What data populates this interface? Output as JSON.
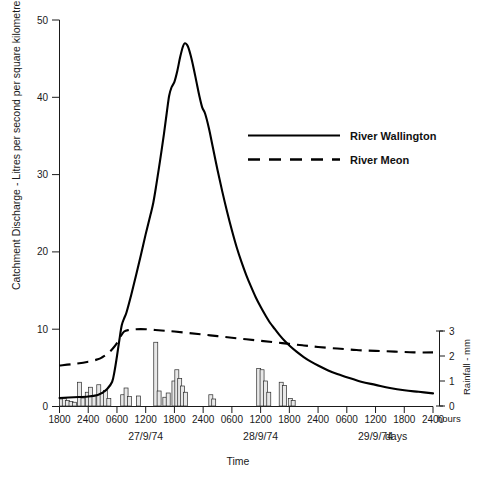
{
  "chart_data": {
    "type": "line",
    "title": "",
    "xlabel": "Time",
    "ylabel": "Catchment Discharge - Litres per second per square kilometre",
    "y2label": "Rainfall - mm",
    "xlim": [
      0,
      54
    ],
    "ylim": [
      0,
      50
    ],
    "y2lim": [
      0,
      3
    ],
    "grid": false,
    "legend_position": "upper right",
    "x_unit_label": "hours",
    "day_unit_label": "days",
    "x_tick_labels": [
      "1800",
      "2400",
      "0600",
      "1200",
      "1800",
      "2400",
      "0600",
      "1200",
      "1800",
      "2400",
      "0600",
      "1200",
      "1800",
      "2400"
    ],
    "x_tick_hours": [
      0,
      6,
      12,
      18,
      24,
      30,
      36,
      42,
      48,
      54,
      60,
      66,
      72,
      78
    ],
    "y_tick_labels": [
      "0",
      "10",
      "20",
      "30",
      "40",
      "50"
    ],
    "y_tick_values": [
      0,
      10,
      20,
      30,
      40,
      50
    ],
    "y2_tick_labels": [
      "0",
      "1",
      "2",
      "3"
    ],
    "y2_tick_values": [
      0,
      1,
      2,
      3
    ],
    "day_labels": [
      {
        "text": "27/9/74",
        "hour": 18
      },
      {
        "text": "28/9/74",
        "hour": 42
      },
      {
        "text": "29/9/74",
        "hour": 66
      }
    ],
    "series": [
      {
        "name": "River Wallington",
        "style": "solid",
        "points": [
          [
            0,
            1.1
          ],
          [
            3,
            1.2
          ],
          [
            6,
            1.3
          ],
          [
            8,
            1.5
          ],
          [
            9,
            1.8
          ],
          [
            10,
            2.3
          ],
          [
            11,
            3.2
          ],
          [
            11.5,
            4.6
          ],
          [
            12,
            6.5
          ],
          [
            12.5,
            8.6
          ],
          [
            13,
            10.5
          ],
          [
            13.5,
            11.4
          ],
          [
            14,
            12.2
          ],
          [
            15,
            14.5
          ],
          [
            16,
            17.0
          ],
          [
            17,
            19.6
          ],
          [
            18,
            22.3
          ],
          [
            19,
            24.8
          ],
          [
            19.6,
            26.4
          ],
          [
            20.2,
            28.6
          ],
          [
            21,
            31.8
          ],
          [
            21.8,
            35.2
          ],
          [
            22.4,
            38.0
          ],
          [
            22.9,
            40.2
          ],
          [
            23.4,
            41.3
          ],
          [
            24.0,
            42.0
          ],
          [
            24.6,
            43.4
          ],
          [
            25.2,
            45.2
          ],
          [
            25.8,
            46.6
          ],
          [
            26.2,
            47.0
          ],
          [
            26.8,
            46.6
          ],
          [
            27.4,
            45.4
          ],
          [
            28.0,
            43.8
          ],
          [
            28.6,
            42.0
          ],
          [
            29.2,
            40.2
          ],
          [
            29.8,
            38.7
          ],
          [
            30.4,
            37.9
          ],
          [
            31.2,
            36.0
          ],
          [
            32.0,
            33.6
          ],
          [
            33.0,
            30.6
          ],
          [
            34.0,
            27.8
          ],
          [
            35.0,
            25.2
          ],
          [
            36.0,
            22.8
          ],
          [
            37.0,
            20.6
          ],
          [
            38.0,
            18.7
          ],
          [
            39.0,
            17.0
          ],
          [
            40.0,
            15.5
          ],
          [
            41.0,
            14.1
          ],
          [
            42.0,
            12.9
          ],
          [
            43.0,
            11.8
          ],
          [
            44.0,
            10.8
          ],
          [
            45.0,
            10.0
          ],
          [
            46.0,
            9.2
          ],
          [
            47.0,
            8.5
          ],
          [
            48.0,
            7.9
          ],
          [
            49.5,
            7.1
          ],
          [
            51.0,
            6.4
          ],
          [
            52.5,
            5.8
          ],
          [
            54.0,
            5.3
          ],
          [
            56.0,
            4.7
          ],
          [
            58.0,
            4.2
          ],
          [
            60.0,
            3.8
          ],
          [
            63.0,
            3.2
          ],
          [
            66.0,
            2.8
          ],
          [
            69.0,
            2.4
          ],
          [
            72.0,
            2.1
          ],
          [
            75.0,
            1.9
          ],
          [
            78.0,
            1.7
          ]
        ]
      },
      {
        "name": "River Meon",
        "style": "dashed",
        "points": [
          [
            0,
            5.3
          ],
          [
            3,
            5.5
          ],
          [
            6,
            5.8
          ],
          [
            8,
            6.1
          ],
          [
            9,
            6.4
          ],
          [
            10,
            6.8
          ],
          [
            11,
            7.4
          ],
          [
            12,
            8.2
          ],
          [
            12.8,
            9.1
          ],
          [
            13.5,
            9.7
          ],
          [
            14.5,
            9.9
          ],
          [
            16,
            10.0
          ],
          [
            18,
            10.0
          ],
          [
            20,
            9.9
          ],
          [
            22,
            9.8
          ],
          [
            24,
            9.7
          ],
          [
            27,
            9.5
          ],
          [
            30,
            9.3
          ],
          [
            33,
            9.1
          ],
          [
            36,
            8.9
          ],
          [
            39,
            8.7
          ],
          [
            42,
            8.5
          ],
          [
            45,
            8.3
          ],
          [
            48,
            8.1
          ],
          [
            51,
            7.9
          ],
          [
            54,
            7.7
          ],
          [
            58,
            7.5
          ],
          [
            62,
            7.3
          ],
          [
            66,
            7.2
          ],
          [
            70,
            7.1
          ],
          [
            74,
            7.0
          ],
          [
            78,
            7.0
          ]
        ]
      }
    ],
    "rainfall_bars": [
      {
        "hour": 0.4,
        "value": 0.28
      },
      {
        "hour": 1.0,
        "value": 0.3
      },
      {
        "hour": 1.7,
        "value": 0.22
      },
      {
        "hour": 2.4,
        "value": 0.18
      },
      {
        "hour": 3.1,
        "value": 0.15
      },
      {
        "hour": 4.2,
        "value": 0.95
      },
      {
        "hour": 4.9,
        "value": 0.32
      },
      {
        "hour": 5.8,
        "value": 0.55
      },
      {
        "hour": 6.5,
        "value": 0.75
      },
      {
        "hour": 7.2,
        "value": 0.42
      },
      {
        "hour": 8.2,
        "value": 0.85
      },
      {
        "hour": 8.9,
        "value": 0.5
      },
      {
        "hour": 9.6,
        "value": 0.62
      },
      {
        "hour": 10.3,
        "value": 0.3
      },
      {
        "hour": 13.2,
        "value": 0.45
      },
      {
        "hour": 13.9,
        "value": 0.72
      },
      {
        "hour": 14.6,
        "value": 0.38
      },
      {
        "hour": 16.5,
        "value": 0.4
      },
      {
        "hour": 20.1,
        "value": 2.55
      },
      {
        "hour": 20.8,
        "value": 0.6
      },
      {
        "hour": 22.0,
        "value": 0.35
      },
      {
        "hour": 22.7,
        "value": 0.52
      },
      {
        "hour": 23.9,
        "value": 1.0
      },
      {
        "hour": 24.5,
        "value": 1.45
      },
      {
        "hour": 25.1,
        "value": 1.1
      },
      {
        "hour": 25.7,
        "value": 0.8
      },
      {
        "hour": 26.3,
        "value": 0.55
      },
      {
        "hour": 31.6,
        "value": 0.45
      },
      {
        "hour": 32.2,
        "value": 0.28
      },
      {
        "hour": 41.6,
        "value": 1.5
      },
      {
        "hour": 42.3,
        "value": 1.45
      },
      {
        "hour": 43.0,
        "value": 1.0
      },
      {
        "hour": 43.7,
        "value": 0.55
      },
      {
        "hour": 46.3,
        "value": 0.95
      },
      {
        "hour": 47.0,
        "value": 0.82
      },
      {
        "hour": 48.2,
        "value": 0.3
      },
      {
        "hour": 48.8,
        "value": 0.22
      }
    ]
  },
  "legend": {
    "entries": [
      {
        "label": "River Wallington",
        "style": "solid"
      },
      {
        "label": "River Meon",
        "style": "dashed"
      }
    ]
  }
}
